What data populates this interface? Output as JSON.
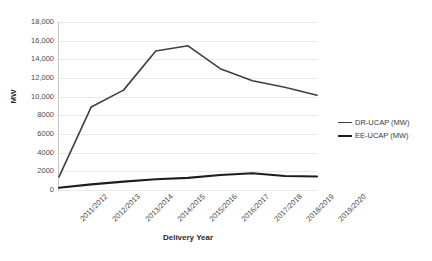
{
  "chart_data": {
    "type": "line",
    "title": "",
    "xlabel": "Delivery Year",
    "ylabel": "MW",
    "categories": [
      "2011/2012",
      "2012/2013",
      "2013/2014",
      "2014/2015",
      "2015/2016",
      "2016/2017",
      "2017/2018",
      "2018/2019",
      "2019/2020"
    ],
    "series": [
      {
        "name": "DR-UCAP (MW)",
        "color": "#3f3f3f",
        "width": 1.6,
        "values": [
          1400,
          8900,
          10700,
          14900,
          15450,
          13000,
          11700,
          11000,
          10150
        ]
      },
      {
        "name": "EE-UCAP (MW)",
        "color": "#1d1d1d",
        "width": 2.1,
        "values": [
          250,
          600,
          900,
          1150,
          1300,
          1600,
          1800,
          1500,
          1450
        ]
      }
    ],
    "ylim": [
      0,
      18000
    ],
    "y_ticks": [
      "18,000",
      "16,000",
      "14,000",
      "12,000",
      "10,000",
      "8000",
      "6000",
      "4000",
      "2000",
      "0"
    ],
    "y_tick_values": [
      18000,
      16000,
      14000,
      12000,
      10000,
      8000,
      6000,
      4000,
      2000,
      0
    ],
    "grid": true,
    "legend_position": "right"
  }
}
